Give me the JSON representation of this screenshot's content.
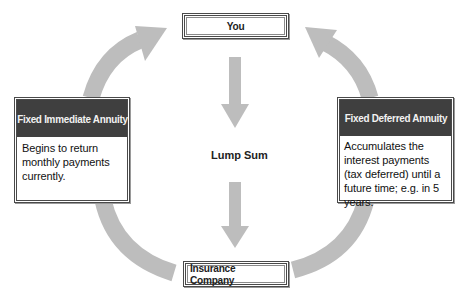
{
  "diagram": {
    "nodes": {
      "you": {
        "label": "You"
      },
      "insurance": {
        "label": "Insurance Company"
      },
      "immediate": {
        "title": "Fixed Immediate Annuity",
        "description": "Begins to return monthly payments currently."
      },
      "deferred": {
        "title": "Fixed Deferred Annuity",
        "description": "Accumulates the interest payments (tax deferred) until a future time; e.g. in 5 years."
      }
    },
    "center_label": "Lump Sum",
    "edges": [
      {
        "from": "You",
        "to": "Insurance Company",
        "label": "Lump Sum",
        "style": "straight-down"
      },
      {
        "from": "Insurance Company",
        "to": "Fixed Immediate Annuity",
        "style": "curved"
      },
      {
        "from": "Fixed Immediate Annuity",
        "to": "You",
        "style": "curved-arrow"
      },
      {
        "from": "Insurance Company",
        "to": "Fixed Deferred Annuity",
        "style": "curved"
      },
      {
        "from": "Fixed Deferred Annuity",
        "to": "You",
        "style": "curved-arrow"
      }
    ],
    "colors": {
      "arrow": "#bdbdbd",
      "header_bg": "#3f3f3f",
      "header_text": "#f2f2f2",
      "border": "#4a4a4a"
    }
  }
}
